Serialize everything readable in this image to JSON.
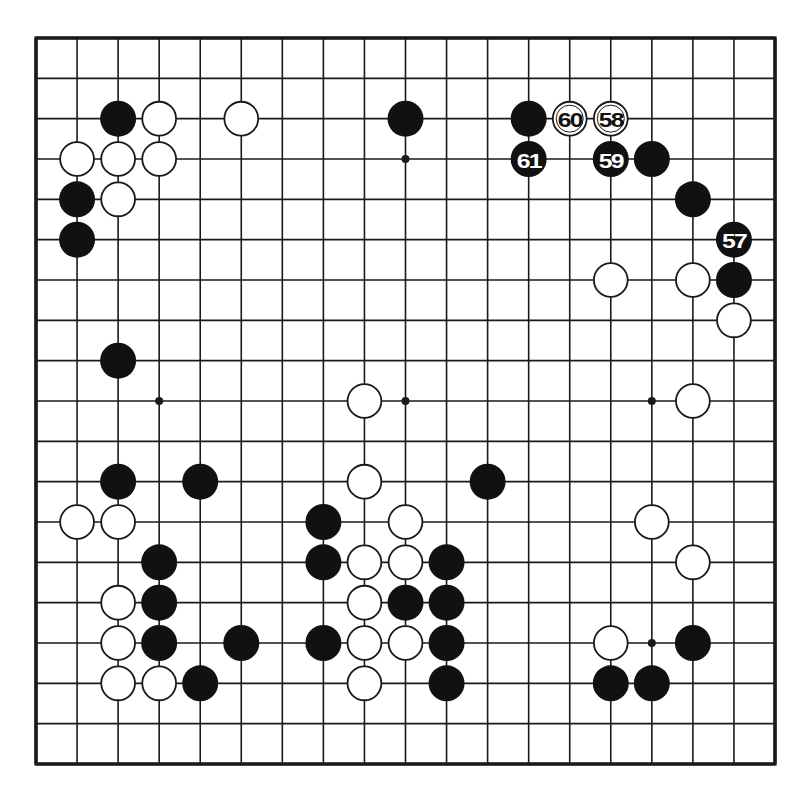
{
  "diagram": {
    "type": "go-board",
    "size": 19,
    "colors": {
      "background": "#ffffff",
      "line": "#1a1a1a",
      "black_stone": "#111111",
      "white_stone": "#ffffff",
      "black_label": "#ffffff",
      "white_label": "#111111"
    },
    "geometry": {
      "left": 36,
      "top": 38,
      "right": 775,
      "bottom": 764,
      "stone_radius": 17.5,
      "star_radius": 4
    },
    "star_points": [
      [
        9,
        3
      ],
      [
        3,
        9
      ],
      [
        9,
        9
      ],
      [
        15,
        9
      ],
      [
        15,
        15
      ],
      [
        3,
        3
      ],
      [
        15,
        3
      ],
      [
        3,
        15
      ],
      [
        9,
        15
      ]
    ],
    "black_stones": [
      [
        2,
        2
      ],
      [
        9,
        2
      ],
      [
        12,
        2
      ],
      [
        15,
        3
      ],
      [
        1,
        4
      ],
      [
        16,
        4
      ],
      [
        1,
        5
      ],
      [
        17,
        6
      ],
      [
        2,
        8
      ],
      [
        2,
        11
      ],
      [
        4,
        11
      ],
      [
        11,
        11
      ],
      [
        7,
        12
      ],
      [
        3,
        13
      ],
      [
        7,
        13
      ],
      [
        10,
        13
      ],
      [
        3,
        14
      ],
      [
        9,
        14
      ],
      [
        10,
        14
      ],
      [
        3,
        15
      ],
      [
        5,
        15
      ],
      [
        7,
        15
      ],
      [
        10,
        15
      ],
      [
        16,
        15
      ],
      [
        4,
        16
      ],
      [
        10,
        16
      ],
      [
        14,
        16
      ],
      [
        15,
        16
      ]
    ],
    "white_stones": [
      [
        3,
        2
      ],
      [
        5,
        2
      ],
      [
        1,
        3
      ],
      [
        2,
        3
      ],
      [
        3,
        3
      ],
      [
        2,
        4
      ],
      [
        14,
        6
      ],
      [
        16,
        6
      ],
      [
        17,
        7
      ],
      [
        8,
        9
      ],
      [
        16,
        9
      ],
      [
        8,
        11
      ],
      [
        1,
        12
      ],
      [
        2,
        12
      ],
      [
        9,
        12
      ],
      [
        15,
        12
      ],
      [
        8,
        13
      ],
      [
        9,
        13
      ],
      [
        16,
        13
      ],
      [
        2,
        14
      ],
      [
        8,
        14
      ],
      [
        2,
        15
      ],
      [
        8,
        15
      ],
      [
        9,
        15
      ],
      [
        14,
        15
      ],
      [
        2,
        16
      ],
      [
        3,
        16
      ],
      [
        8,
        16
      ]
    ],
    "numbered_moves": [
      {
        "number": "57",
        "color": "black",
        "col": 17,
        "row": 5
      },
      {
        "number": "58",
        "color": "white",
        "col": 14,
        "row": 2
      },
      {
        "number": "59",
        "color": "black",
        "col": 14,
        "row": 3
      },
      {
        "number": "60",
        "color": "white",
        "col": 13,
        "row": 2
      },
      {
        "number": "61",
        "color": "black",
        "col": 12,
        "row": 3
      }
    ]
  }
}
